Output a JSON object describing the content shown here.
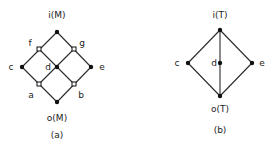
{
  "diagrams": [
    {
      "id": "a",
      "caption": "(a)",
      "top_label": "i(M)",
      "bottom_label": "o(M)",
      "nodes": [
        {
          "name": "top",
          "x": 57,
          "y": 32,
          "style": "filled"
        },
        {
          "name": "f",
          "label": "f",
          "x": 39,
          "y": 49,
          "style": "open"
        },
        {
          "name": "g",
          "label": "g",
          "x": 74,
          "y": 49,
          "style": "open"
        },
        {
          "name": "c",
          "label": "c",
          "x": 22,
          "y": 67,
          "style": "filled"
        },
        {
          "name": "d",
          "label": "d",
          "x": 57,
          "y": 67,
          "style": "filled"
        },
        {
          "name": "e",
          "label": "e",
          "x": 91,
          "y": 67,
          "style": "filled"
        },
        {
          "name": "a",
          "label": "a",
          "x": 39,
          "y": 84,
          "style": "open"
        },
        {
          "name": "b",
          "label": "b",
          "x": 74,
          "y": 84,
          "style": "open"
        },
        {
          "name": "bottom",
          "x": 57,
          "y": 102,
          "style": "filled"
        }
      ],
      "edges": [
        [
          "top",
          "f"
        ],
        [
          "top",
          "g"
        ],
        [
          "f",
          "c"
        ],
        [
          "f",
          "d"
        ],
        [
          "g",
          "d"
        ],
        [
          "g",
          "e"
        ],
        [
          "c",
          "a"
        ],
        [
          "d",
          "a"
        ],
        [
          "d",
          "b"
        ],
        [
          "e",
          "b"
        ],
        [
          "a",
          "bottom"
        ],
        [
          "b",
          "bottom"
        ]
      ]
    },
    {
      "id": "b",
      "caption": "(b)",
      "top_label": "i(T)",
      "bottom_label": "o(T)",
      "nodes": [
        {
          "name": "top",
          "x": 220,
          "y": 30,
          "style": "filled"
        },
        {
          "name": "c",
          "label": "c",
          "x": 188,
          "y": 63,
          "style": "filled"
        },
        {
          "name": "d",
          "label": "d",
          "x": 220,
          "y": 63,
          "style": "filled"
        },
        {
          "name": "e",
          "label": "e",
          "x": 252,
          "y": 63,
          "style": "filled"
        },
        {
          "name": "bottom",
          "x": 220,
          "y": 96,
          "style": "filled"
        }
      ],
      "edges": [
        [
          "top",
          "c"
        ],
        [
          "top",
          "d"
        ],
        [
          "top",
          "e"
        ],
        [
          "c",
          "bottom"
        ],
        [
          "d",
          "bottom"
        ],
        [
          "e",
          "bottom"
        ]
      ]
    }
  ]
}
